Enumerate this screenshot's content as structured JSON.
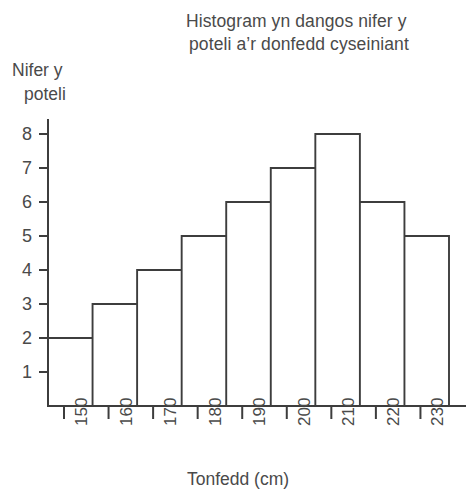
{
  "title": {
    "line1": "Histogram yn dangos nifer y",
    "line2": "poteli a’r donfedd cyseiniant"
  },
  "axes": {
    "y_caption_line1": "Nifer y",
    "y_caption_line2": "poteli",
    "x_caption": "Tonfedd (cm)"
  },
  "chart_data": {
    "type": "bar",
    "title": "Histogram yn dangos nifer y poteli a’r donfedd cyseiniant",
    "xlabel": "Tonfedd (cm)",
    "ylabel": "Nifer y poteli",
    "categories": [
      "150",
      "160",
      "170",
      "180",
      "190",
      "200",
      "210",
      "220",
      "230"
    ],
    "values": [
      2,
      3,
      4,
      5,
      6,
      7,
      8,
      6,
      5
    ],
    "bin_edges": [
      150,
      160,
      170,
      180,
      190,
      200,
      210,
      220,
      230,
      240
    ],
    "ylim": [
      0,
      8.6
    ],
    "ytick_labels": [
      "1",
      "2",
      "3",
      "4",
      "5",
      "6",
      "7",
      "8"
    ],
    "ytick_values": [
      1,
      2,
      3,
      4,
      5,
      6,
      7,
      8
    ],
    "xtick_labels": [
      "150",
      "160",
      "170",
      "180",
      "190",
      "200",
      "210",
      "220",
      "230"
    ],
    "xtick_rotation": 90,
    "grid": false,
    "legend": false,
    "bar_fill": "none",
    "stroke_color": "#3d3d3d",
    "background": "#ffffff"
  }
}
